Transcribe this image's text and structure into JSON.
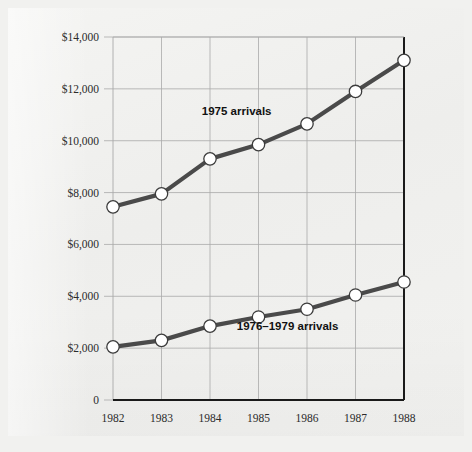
{
  "figure": {
    "background_color": "#f1f1ef",
    "paper_color": "#f2f2f0",
    "frame": "scanned-page"
  },
  "chart_data": {
    "type": "line",
    "title": "",
    "subtitle": "",
    "xlabel": "",
    "ylabel": "",
    "x": [
      1982,
      1983,
      1984,
      1985,
      1986,
      1987,
      1988
    ],
    "categories": [
      "1982",
      "1983",
      "1984",
      "1985",
      "1986",
      "1987",
      "1988"
    ],
    "xtick_labels": [
      "1982",
      "1983",
      "1984",
      "1985",
      "1986",
      "1987",
      "1988"
    ],
    "ytick_labels": [
      "0",
      "$2,000",
      "$4,000",
      "$6,000",
      "$8,000",
      "$10,000",
      "$12,000",
      "$14,000"
    ],
    "ytick_values": [
      0,
      2000,
      4000,
      6000,
      8000,
      10000,
      12000,
      14000
    ],
    "ylim": [
      0,
      14000
    ],
    "xlim": [
      1982,
      1988
    ],
    "grid": true,
    "grid_color": "#a9a9a9",
    "legend_position": "inline-annotation",
    "marker": "circle-white-dark-edge",
    "line_color": "#4a4a4a",
    "marker_face_color": "#ffffff",
    "marker_edge_color": "#3c3c3c",
    "series": [
      {
        "name": "1975 arrivals",
        "label_x": 1984.55,
        "label_y": 11150,
        "values": [
          7450,
          7950,
          9300,
          9850,
          10650,
          11900,
          13100
        ]
      },
      {
        "name": "1976–1979 arrivals",
        "label_x": 1985.6,
        "label_y": 2850,
        "values": [
          2050,
          2300,
          2850,
          3200,
          3500,
          4050,
          4550
        ]
      }
    ],
    "annotations": [
      {
        "text": "1975 arrivals",
        "x": 1984.55,
        "y": 11150
      },
      {
        "text": "1976–1979 arrivals",
        "x": 1985.6,
        "y": 2850
      }
    ]
  }
}
